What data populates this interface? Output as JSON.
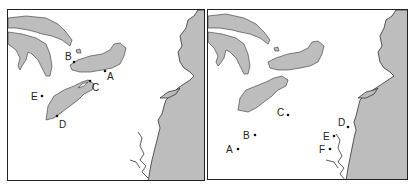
{
  "maps": [
    {
      "id": "left",
      "description": "Great Lakes and northeastern US coast with labeled points",
      "points": [
        {
          "label": "A"
        },
        {
          "label": "B"
        },
        {
          "label": "C"
        },
        {
          "label": "D"
        },
        {
          "label": "E"
        }
      ]
    },
    {
      "id": "right",
      "description": "Great Lakes and northeastern US coast with labeled points",
      "points": [
        {
          "label": "A"
        },
        {
          "label": "B"
        },
        {
          "label": "C"
        },
        {
          "label": "D"
        },
        {
          "label": "E"
        },
        {
          "label": "F"
        }
      ]
    }
  ],
  "colors": {
    "land": "#bdbdbd",
    "water": "#ffffff",
    "outline": "#333333"
  }
}
